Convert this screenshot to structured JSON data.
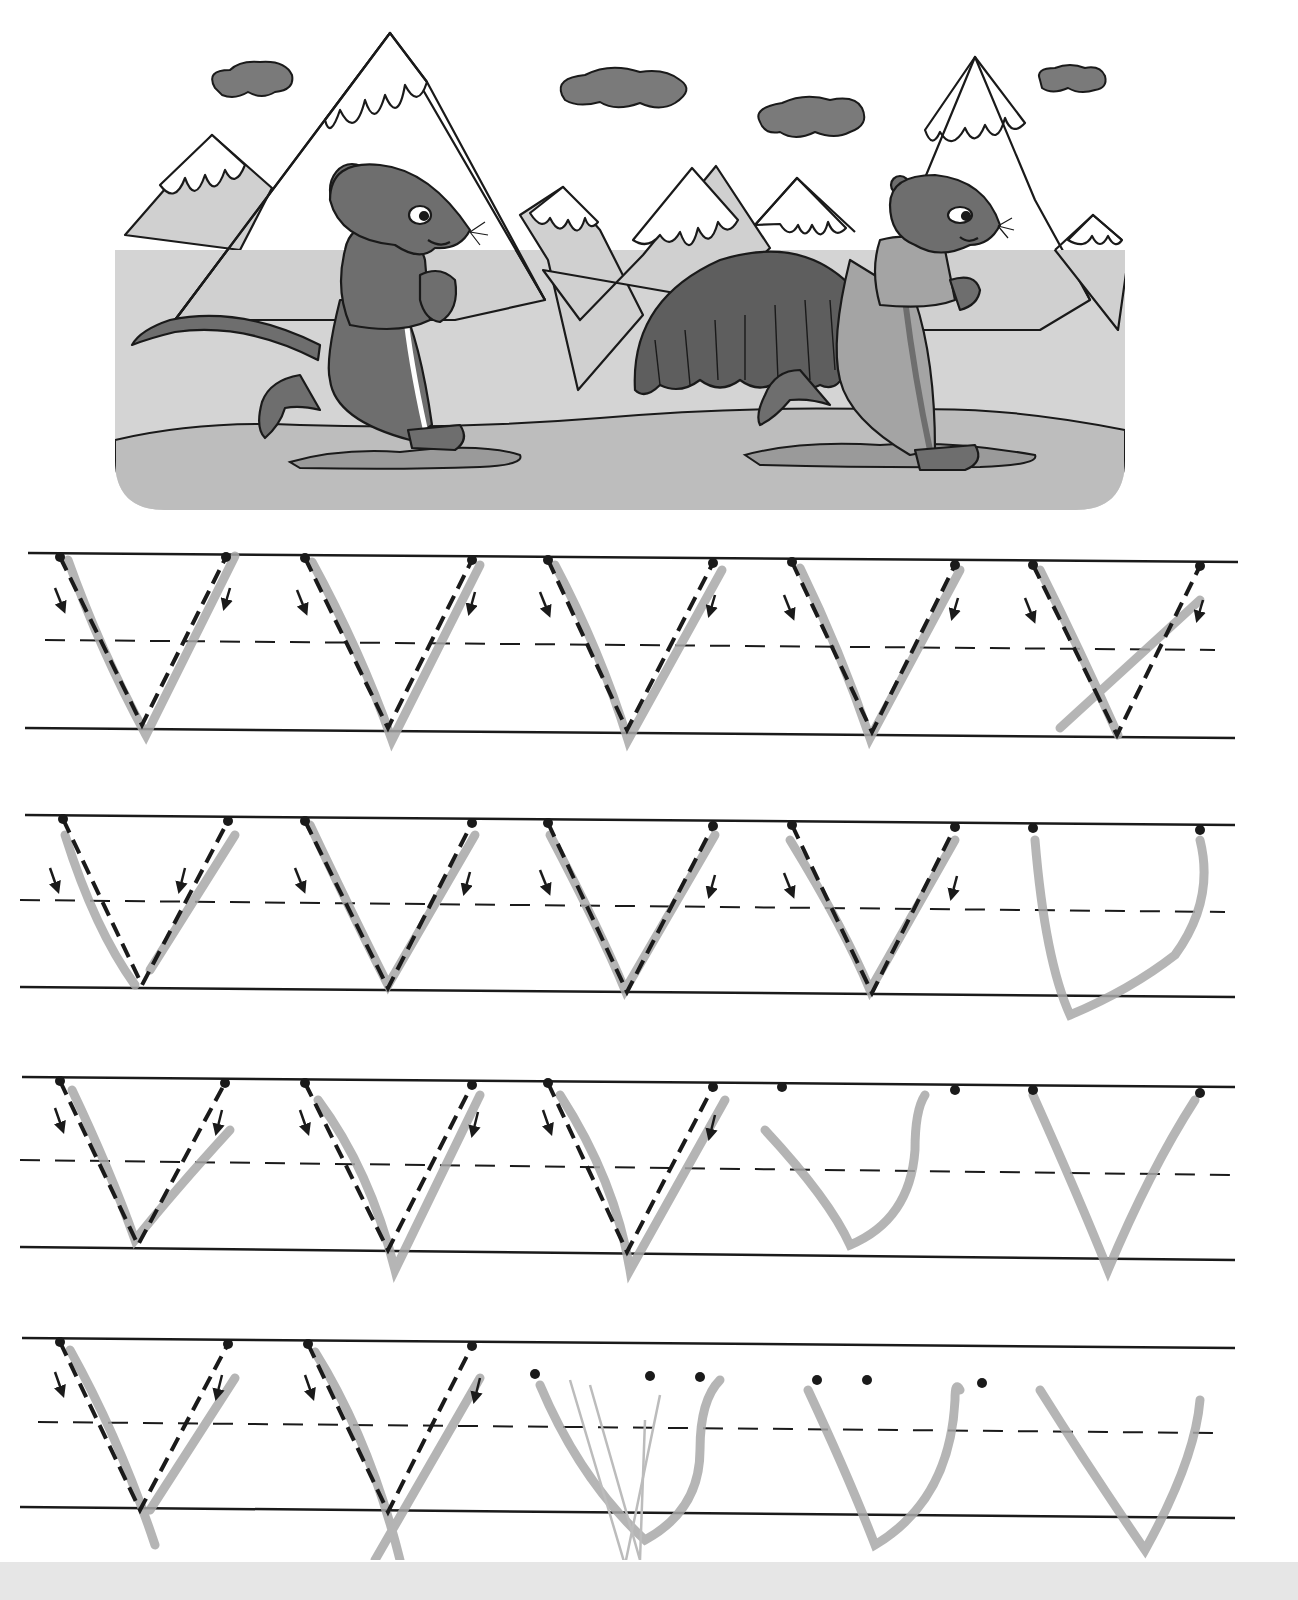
{
  "worksheet": {
    "title": "Letter V handwriting practice",
    "letter": "V",
    "colors": {
      "paper": "#ffffff",
      "ink": "#1a1a1a",
      "pencil": "#a8a8a8",
      "scene_bg": "#d4d4d4",
      "ground": "#bdbdbd",
      "mountain": "#d0d0d0",
      "snow": "#ffffff",
      "cloud": "#7a7a7a",
      "mouse": "#6e6e6e",
      "bush": "#5e5e5e",
      "bottom_band": "#e6e6e6"
    }
  },
  "illustration": {
    "description": "Two cartoon rodents in tracksuits running past snow-capped mountains",
    "characters": [
      {
        "name": "mouse",
        "position": "left",
        "outfit": "dark tracksuit with white stripe"
      },
      {
        "name": "marmot",
        "position": "right",
        "outfit": "light tracksuit, carrying a shaggy bundle"
      }
    ],
    "elements": [
      "clouds",
      "snow-capped mountains",
      "bush",
      "ground",
      "puddles"
    ]
  },
  "practice": {
    "rows": [
      {
        "index": 1,
        "traced_letters": 5,
        "free_letters": 0,
        "top_y": 553,
        "mid_y": 640,
        "bottom_y": 730
      },
      {
        "index": 2,
        "traced_letters": 4,
        "free_letters": 1,
        "top_y": 815,
        "mid_y": 905,
        "bottom_y": 992
      },
      {
        "index": 3,
        "traced_letters": 3,
        "free_letters": 2,
        "top_y": 1077,
        "mid_y": 1167,
        "bottom_y": 1255
      },
      {
        "index": 4,
        "traced_letters": 2,
        "free_letters": 3,
        "top_y": 1338,
        "mid_y": 1428,
        "bottom_y": 1517
      }
    ],
    "letter_columns_x": [
      [
        62,
        142,
        228
      ],
      [
        305,
        388,
        472
      ],
      [
        548,
        627,
        713
      ],
      [
        792,
        872,
        955
      ],
      [
        1033,
        1117,
        1200
      ]
    ]
  }
}
